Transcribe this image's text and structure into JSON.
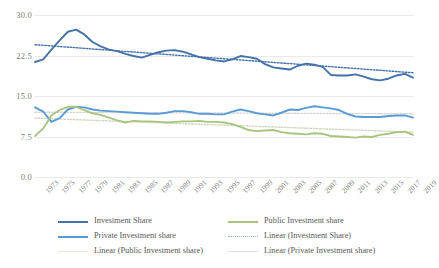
{
  "chart_data": {
    "type": "line",
    "title": "",
    "xlabel": "",
    "ylabel": "",
    "ylim": [
      0.0,
      30.0
    ],
    "yticks": [
      "0.0",
      "7.5",
      "15.0",
      "22.5",
      "30.0"
    ],
    "ytick_values": [
      0.0,
      7.5,
      15.0,
      22.5,
      30.0
    ],
    "grid": true,
    "legend_position": "bottom",
    "x": [
      1973,
      1974,
      1975,
      1976,
      1977,
      1978,
      1979,
      1980,
      1981,
      1982,
      1983,
      1984,
      1985,
      1986,
      1987,
      1988,
      1989,
      1990,
      1991,
      1992,
      1993,
      1994,
      1995,
      1996,
      1997,
      1998,
      1999,
      2000,
      2001,
      2002,
      2003,
      2004,
      2005,
      2006,
      2007,
      2008,
      2009,
      2010,
      2011,
      2012,
      2013,
      2014,
      2015,
      2016,
      2017,
      2018,
      2019
    ],
    "xtick_labels": [
      "1973",
      "1975",
      "1977",
      "1979",
      "1981",
      "1983",
      "1985",
      "1987",
      "1989",
      "1991",
      "1993",
      "1995",
      "1997",
      "1999",
      "2001",
      "2003",
      "2005",
      "2007",
      "2009",
      "2011",
      "2013",
      "2015",
      "2017",
      "2019"
    ],
    "series": [
      {
        "name": "Investment Share",
        "color": "#4472a8",
        "style": "solid",
        "values": [
          21.3,
          21.8,
          23.6,
          25.3,
          26.9,
          27.3,
          26.4,
          25.0,
          24.2,
          23.6,
          23.3,
          22.8,
          22.4,
          22.1,
          22.6,
          23.1,
          23.4,
          23.5,
          23.2,
          22.7,
          22.2,
          21.9,
          21.6,
          21.4,
          21.8,
          22.4,
          22.2,
          21.9,
          20.9,
          20.3,
          20.1,
          19.9,
          20.6,
          21.0,
          20.8,
          20.4,
          18.9,
          18.8,
          18.8,
          19.0,
          18.6,
          18.1,
          17.9,
          18.2,
          18.8,
          19.1,
          18.4
        ]
      },
      {
        "name": "Private Investment share",
        "color": "#5b9bd5",
        "style": "solid",
        "values": [
          12.9,
          12.1,
          10.2,
          10.9,
          12.5,
          13.0,
          12.9,
          12.5,
          12.3,
          12.2,
          12.1,
          12.0,
          11.9,
          11.8,
          11.7,
          11.7,
          11.9,
          12.2,
          12.2,
          12.0,
          11.7,
          11.7,
          11.6,
          11.6,
          12.1,
          12.5,
          12.2,
          11.8,
          11.6,
          11.4,
          11.9,
          12.5,
          12.4,
          12.8,
          13.1,
          12.9,
          12.7,
          12.4,
          11.7,
          11.2,
          11.1,
          11.1,
          11.1,
          11.3,
          11.4,
          11.4,
          11.0
        ]
      },
      {
        "name": "Public Investment share",
        "color": "#a9c47f",
        "style": "solid",
        "values": [
          7.6,
          9.0,
          11.4,
          12.4,
          13.0,
          13.0,
          12.4,
          11.8,
          11.5,
          11.0,
          10.5,
          10.1,
          10.4,
          10.3,
          10.3,
          10.2,
          10.1,
          10.2,
          10.3,
          10.3,
          10.4,
          10.2,
          10.2,
          10.1,
          9.8,
          9.3,
          8.7,
          8.5,
          8.6,
          8.7,
          8.3,
          8.1,
          8.0,
          7.9,
          8.1,
          8.0,
          7.6,
          7.5,
          7.4,
          7.3,
          7.5,
          7.4,
          7.8,
          8.0,
          8.3,
          8.4,
          7.8
        ]
      }
    ],
    "trendlines": [
      {
        "name": "Linear (Investment Share)",
        "color": "#4472a8",
        "style": "dotted",
        "y_start": 24.5,
        "y_end": 19.3
      },
      {
        "name": "Linear (Public Investment share)",
        "color": "#cfd9c0",
        "style": "dotted",
        "y_start": 10.9,
        "y_end": 8.3
      },
      {
        "name": "Linear (Private Investment share)",
        "color": "#d6d6d6",
        "style": "dotted",
        "y_start": 12.0,
        "y_end": 11.7
      }
    ]
  },
  "legend": {
    "items": [
      {
        "label": "Investment Share",
        "color": "#4472a8",
        "style": "solid"
      },
      {
        "label": "Public Investment share",
        "color": "#a9c47f",
        "style": "solid"
      },
      {
        "label": "Private Investment share",
        "color": "#5b9bd5",
        "style": "solid"
      },
      {
        "label": "Linear (Investment Share)",
        "color": "#8faad0",
        "style": "dotted"
      },
      {
        "label": "Linear (Public Investment share)",
        "color": "#e2e8da",
        "style": "solid"
      },
      {
        "label": "Linear (Private Investment share)",
        "color": "#e0e0e0",
        "style": "solid"
      }
    ]
  }
}
